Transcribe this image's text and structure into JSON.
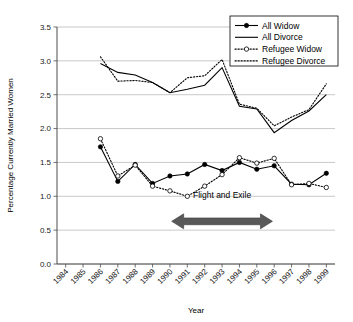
{
  "chart_data": {
    "type": "line",
    "title": "",
    "xlabel": "Year",
    "ylabel": "Percentage Currently Married Women",
    "grid": true,
    "legend_position": "top-right",
    "xlim": [
      1983.5,
      1999.5
    ],
    "ylim": [
      0.0,
      3.5
    ],
    "ytick_labels": [
      "0.0",
      "0.5",
      "1.0",
      "1.5",
      "2.0",
      "2.5",
      "3.0",
      "3.5"
    ],
    "ytick_values": [
      0.0,
      0.5,
      1.0,
      1.5,
      2.0,
      2.5,
      3.0,
      3.5
    ],
    "categories": [
      "1984",
      "1985",
      "1986",
      "1987",
      "1988",
      "1989",
      "1990",
      "1991",
      "1992",
      "1993",
      "1994",
      "1995",
      "1996",
      "1997",
      "1998",
      "1999"
    ],
    "x": [
      1984,
      1985,
      1986,
      1987,
      1988,
      1989,
      1990,
      1991,
      1992,
      1993,
      1994,
      1995,
      1996,
      1997,
      1998,
      1999
    ],
    "series": [
      {
        "name": "All Widow",
        "style": "solid-line-filled-circle",
        "x": [
          1986,
          1987,
          1988,
          1989,
          1990,
          1991,
          1992,
          1993,
          1994,
          1995,
          1996,
          1997,
          1998,
          1999
        ],
        "values": [
          1.73,
          1.22,
          1.47,
          1.19,
          1.3,
          1.33,
          1.47,
          1.38,
          1.5,
          1.4,
          1.45,
          1.18,
          1.17,
          1.34
        ]
      },
      {
        "name": "All Divorce",
        "style": "solid-line",
        "x": [
          1986,
          1987,
          1988,
          1989,
          1990,
          1991,
          1992,
          1993,
          1994,
          1995,
          1996,
          1997,
          1998,
          1999
        ],
        "values": [
          2.96,
          2.83,
          2.79,
          2.68,
          2.53,
          2.58,
          2.64,
          2.9,
          2.33,
          2.29,
          1.94,
          2.12,
          2.26,
          2.5
        ]
      },
      {
        "name": "Refugee Widow",
        "style": "dotted-line-open-circle",
        "x": [
          1986,
          1987,
          1988,
          1989,
          1990,
          1991,
          1992,
          1993,
          1994,
          1995,
          1996,
          1997,
          1998,
          1999
        ],
        "values": [
          1.85,
          1.3,
          1.46,
          1.15,
          1.08,
          1.0,
          1.15,
          1.32,
          1.57,
          1.49,
          1.56,
          1.17,
          1.19,
          1.13
        ]
      },
      {
        "name": "Refugee Divorce",
        "style": "dotted-line",
        "x": [
          1986,
          1987,
          1988,
          1989,
          1990,
          1991,
          1992,
          1993,
          1994,
          1995,
          1996,
          1997,
          1998,
          1999
        ],
        "values": [
          3.06,
          2.7,
          2.71,
          2.68,
          2.53,
          2.75,
          2.78,
          3.02,
          2.36,
          2.3,
          2.04,
          2.17,
          2.28,
          2.66
        ]
      }
    ],
    "annotations": [
      {
        "text": "Flight and Exile",
        "type": "double-headed-arrow",
        "x_start": 1990.1,
        "x_end": 1995.9,
        "y": 0.63,
        "label_y": 0.97,
        "color": "#595959"
      }
    ]
  },
  "legend": {
    "entries": [
      {
        "label": "All Widow"
      },
      {
        "label": "All Divorce"
      },
      {
        "label": "Refugee Widow"
      },
      {
        "label": "Refugee Divorce"
      }
    ]
  },
  "axes": {
    "x_title": "Year",
    "y_title": "Percentage Currently Married Women"
  },
  "colors": {
    "ink": "#000000",
    "grid": "#b0b0b0",
    "axis": "#4d4d4d",
    "arrow": "#595959",
    "background": "#ffffff"
  }
}
